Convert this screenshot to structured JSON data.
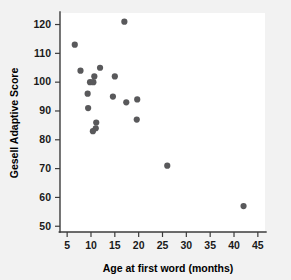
{
  "figure": {
    "background_color": "#f2f2f2",
    "plot_area_color": "#ffffff",
    "marker_color": "#59595b",
    "axis_color": "#3b3b3b",
    "text_color": "#1a1a1a"
  },
  "chart_data": {
    "type": "scatter",
    "title": "",
    "xlabel": "Age at first word (months)",
    "ylabel": "Gesell Adaptive Score",
    "xlim": [
      3.5,
      46.5
    ],
    "ylim": [
      48,
      124
    ],
    "xticks": [
      5,
      10,
      15,
      20,
      25,
      30,
      35,
      40,
      45
    ],
    "xtick_labels": [
      "5",
      "10",
      "15",
      "20",
      "25",
      "30",
      "35",
      "40",
      "45"
    ],
    "yticks": [
      50,
      60,
      70,
      80,
      90,
      100,
      110,
      120
    ],
    "ytick_labels": [
      "50",
      "60",
      "70",
      "80",
      "90",
      "100",
      "110",
      "120"
    ],
    "grid": false,
    "legend": false,
    "marker_size": 3.1,
    "points": [
      {
        "x": 6.6,
        "y": 113
      },
      {
        "x": 7.8,
        "y": 104
      },
      {
        "x": 9.3,
        "y": 96
      },
      {
        "x": 9.4,
        "y": 91
      },
      {
        "x": 9.8,
        "y": 100
      },
      {
        "x": 10.4,
        "y": 83
      },
      {
        "x": 10.5,
        "y": 100
      },
      {
        "x": 10.7,
        "y": 102
      },
      {
        "x": 11.0,
        "y": 84
      },
      {
        "x": 11.1,
        "y": 86
      },
      {
        "x": 11.9,
        "y": 105
      },
      {
        "x": 14.6,
        "y": 95
      },
      {
        "x": 15.0,
        "y": 102
      },
      {
        "x": 17.0,
        "y": 121
      },
      {
        "x": 17.4,
        "y": 93
      },
      {
        "x": 19.6,
        "y": 87
      },
      {
        "x": 19.7,
        "y": 94
      },
      {
        "x": 26.0,
        "y": 71
      },
      {
        "x": 42.0,
        "y": 57
      }
    ]
  }
}
